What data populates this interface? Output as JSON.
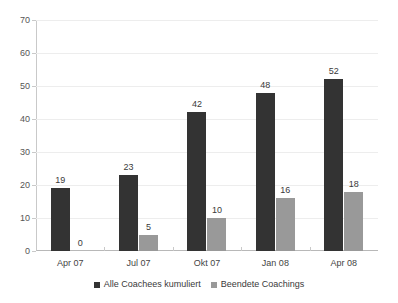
{
  "chart_data": {
    "type": "bar",
    "title": "",
    "subtitle": "",
    "xlabel": "",
    "ylabel": "",
    "ylim": [
      0,
      70
    ],
    "yticks": [
      0,
      10,
      20,
      30,
      40,
      50,
      60,
      70
    ],
    "ytick_labels": [
      "0",
      "10",
      "20",
      "30",
      "40",
      "50",
      "60",
      "70"
    ],
    "grid": true,
    "legend_position": "bottom",
    "categories": [
      "Apr 07",
      "Jul 07",
      "Okt 07",
      "Jan 08",
      "Apr 08"
    ],
    "series": [
      {
        "name": "Alle Coachees kumuliert",
        "color": "#333333",
        "values": [
          19,
          23,
          42,
          48,
          52
        ],
        "labels": [
          "19",
          "23",
          "42",
          "48",
          "52"
        ]
      },
      {
        "name": "Beendete Coachings",
        "color": "#999999",
        "values": [
          0,
          5,
          10,
          16,
          18
        ],
        "labels": [
          "0",
          "5",
          "10",
          "16",
          "18"
        ]
      }
    ]
  },
  "style": {
    "background": "#ffffff",
    "gridline_color": "#ededed",
    "axis_color": "#c9c9c9",
    "text_color": "#444444"
  }
}
